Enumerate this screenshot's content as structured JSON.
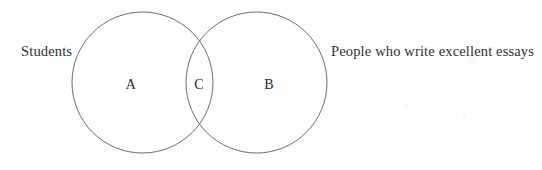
{
  "diagram": {
    "type": "venn-two-set",
    "title": "",
    "background_color": "#fefefe",
    "stroke_color": "#6a6a72",
    "stroke_width": 1,
    "text_color": "#2b2b30",
    "outer_labels": {
      "left": "Students",
      "right": "People who write excellent essays"
    },
    "regions": [
      {
        "key": "a",
        "label": "A",
        "meaning": "Students only",
        "cx": 131,
        "cy": 85
      },
      {
        "key": "c",
        "label": "C",
        "meaning": "Students who write excellent essays",
        "cx": 199,
        "cy": 85
      },
      {
        "key": "b",
        "label": "B",
        "meaning": "People who write excellent essays only",
        "cx": 269,
        "cy": 85
      }
    ],
    "circles": [
      {
        "key": "left-circle",
        "set_label": "Students",
        "cx": 142.5,
        "cy": 82.5,
        "r": 70.5
      },
      {
        "key": "right-circle",
        "set_label": "People who write excellent essays",
        "cx": 256.5,
        "cy": 82.5,
        "r": 70.5
      }
    ],
    "intersection": {
      "top_point_x": 200,
      "top_point_y": 33,
      "bottom_point_x": 200,
      "bottom_point_y": 133
    }
  }
}
